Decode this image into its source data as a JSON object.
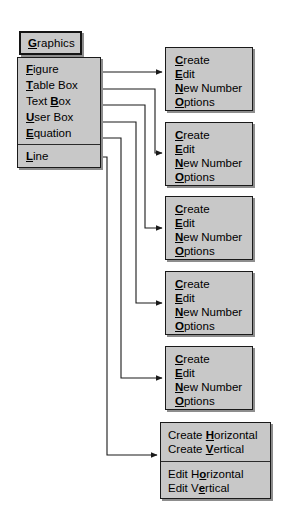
{
  "menubar": {
    "button": {
      "label": "Graphics",
      "accelerator": "G",
      "label_pre": "",
      "label_post": "raphics"
    }
  },
  "graphics_menu": {
    "name": "Graphics",
    "items": [
      {
        "label": "Figure",
        "accelerator": "F",
        "pre": "",
        "post": "igure",
        "target": "submenu-figure"
      },
      {
        "label": "Table Box",
        "accelerator": "T",
        "pre": "",
        "post": "able Box",
        "target": "submenu-table-box"
      },
      {
        "label": "Text Box",
        "accelerator": "B",
        "pre": "Text ",
        "post": "ox",
        "target": "submenu-text-box"
      },
      {
        "label": "User Box",
        "accelerator": "U",
        "pre": "",
        "post": "ser Box",
        "target": "submenu-user-box"
      },
      {
        "label": "Equation",
        "accelerator": "E",
        "pre": "",
        "post": "quation",
        "target": "submenu-equation"
      },
      {
        "label": "Line",
        "accelerator": "L",
        "pre": "",
        "post": "ine",
        "target": "submenu-line"
      }
    ],
    "separator_after_index": 4
  },
  "submenus": {
    "standard_items": [
      {
        "label": "Create",
        "accelerator": "C",
        "pre": "",
        "post": "reate"
      },
      {
        "label": "Edit",
        "accelerator": "E",
        "pre": "",
        "post": "dit"
      },
      {
        "label": "New Number",
        "accelerator": "N",
        "pre": "",
        "post": "ew Number"
      },
      {
        "label": "Options",
        "accelerator": "O",
        "pre": "",
        "post": "ptions"
      }
    ],
    "figure": {
      "title": "Figure",
      "items": [
        {
          "pre": "",
          "accelerator": "C",
          "post": "reate"
        },
        {
          "pre": "",
          "accelerator": "E",
          "post": "dit"
        },
        {
          "pre": "",
          "accelerator": "N",
          "post": "ew Number"
        },
        {
          "pre": "",
          "accelerator": "O",
          "post": "ptions"
        }
      ]
    },
    "table_box": {
      "title": "Table Box",
      "items": [
        {
          "pre": "",
          "accelerator": "C",
          "post": "reate"
        },
        {
          "pre": "",
          "accelerator": "E",
          "post": "dit"
        },
        {
          "pre": "",
          "accelerator": "N",
          "post": "ew Number"
        },
        {
          "pre": "",
          "accelerator": "O",
          "post": "ptions"
        }
      ]
    },
    "text_box": {
      "title": "Text Box",
      "items": [
        {
          "pre": "",
          "accelerator": "C",
          "post": "reate"
        },
        {
          "pre": "",
          "accelerator": "E",
          "post": "dit"
        },
        {
          "pre": "",
          "accelerator": "N",
          "post": "ew Number"
        },
        {
          "pre": "",
          "accelerator": "O",
          "post": "ptions"
        }
      ]
    },
    "user_box": {
      "title": "User Box",
      "items": [
        {
          "pre": "",
          "accelerator": "C",
          "post": "reate"
        },
        {
          "pre": "",
          "accelerator": "E",
          "post": "dit"
        },
        {
          "pre": "",
          "accelerator": "N",
          "post": "ew Number"
        },
        {
          "pre": "",
          "accelerator": "O",
          "post": "ptions"
        }
      ]
    },
    "equation": {
      "title": "Equation",
      "items": [
        {
          "pre": "",
          "accelerator": "C",
          "post": "reate"
        },
        {
          "pre": "",
          "accelerator": "E",
          "post": "dit"
        },
        {
          "pre": "",
          "accelerator": "N",
          "post": "ew Number"
        },
        {
          "pre": "",
          "accelerator": "O",
          "post": "ptions"
        }
      ]
    },
    "line": {
      "title": "Line",
      "groups": [
        {
          "items": [
            {
              "pre": "Create ",
              "accelerator": "H",
              "post": "orizontal"
            },
            {
              "pre": "Create ",
              "accelerator": "V",
              "post": "ertical"
            }
          ]
        },
        {
          "items": [
            {
              "pre": "Edit H",
              "accelerator": "o",
              "post": "rizontal"
            },
            {
              "pre": "Edit V",
              "accelerator": "e",
              "post": "rtical"
            }
          ]
        }
      ]
    }
  },
  "connectors": [
    {
      "from": "Figure",
      "to": "submenu-figure"
    },
    {
      "from": "Table Box",
      "to": "submenu-table-box"
    },
    {
      "from": "Text Box",
      "to": "submenu-text-box"
    },
    {
      "from": "User Box",
      "to": "submenu-user-box"
    },
    {
      "from": "Equation",
      "to": "submenu-equation"
    },
    {
      "from": "Line",
      "to": "submenu-line"
    }
  ],
  "colors": {
    "panel_fill": "#c8c8c8",
    "panel_border": "#1a1a1a",
    "panel_shadow": "#8d8d8d",
    "text": "#000000",
    "page_background": "#ffffff",
    "connector": "#1a1a1a"
  }
}
